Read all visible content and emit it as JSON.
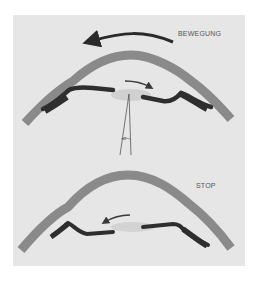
{
  "figure": {
    "panel_background": "#e6e6e6",
    "colors": {
      "cornea": "#8a8a8a",
      "iris": "#2e2e2e",
      "lens": "#d0d0d0",
      "arrow": "#3a3a3a"
    },
    "top_diagram": {
      "label": "BEWEGUNG",
      "angle_label": "α"
    },
    "bottom_diagram": {
      "label": "STOP"
    }
  }
}
